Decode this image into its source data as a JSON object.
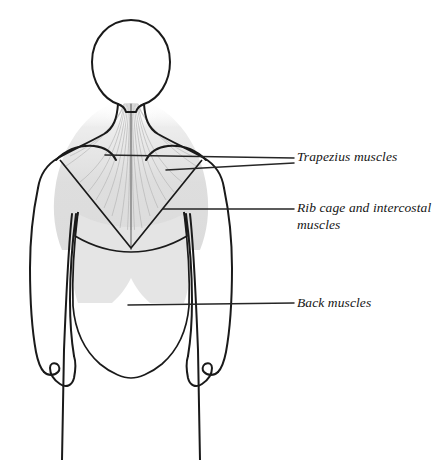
{
  "diagram": {
    "view": "posterior",
    "background_color": "#ffffff",
    "outline_color": "#1a1a1a",
    "shading_color": "#e2e2e2",
    "fiber_color": "#b9b9b9",
    "leader_color": "#262626"
  },
  "labels": [
    {
      "id": "trapezius",
      "text": "Trapezius muscles",
      "leader_count": 2,
      "points_to": "trapezius-region"
    },
    {
      "id": "ribcage",
      "text": "Rib cage and intercostal\nmuscles",
      "leader_count": 1,
      "points_to": "ribcage-region"
    },
    {
      "id": "back",
      "text": "Back muscles",
      "leader_count": 1,
      "points_to": "back-muscle-region"
    }
  ],
  "regions": [
    {
      "id": "trapezius-region",
      "name": "Trapezius muscles",
      "shaded": true,
      "has_fibers": true
    },
    {
      "id": "ribcage-region",
      "name": "Rib cage and intercostal muscles",
      "shaded": true,
      "has_fibers": false
    },
    {
      "id": "back-muscle-region",
      "name": "Back muscles",
      "shaded": false,
      "has_fibers": false
    }
  ],
  "body_parts": [
    {
      "id": "head",
      "name": "head"
    },
    {
      "id": "neck",
      "name": "neck"
    },
    {
      "id": "torso",
      "name": "torso"
    },
    {
      "id": "left-arm",
      "name": "left arm"
    },
    {
      "id": "right-arm",
      "name": "right arm"
    },
    {
      "id": "left-hand",
      "name": "left hand"
    },
    {
      "id": "right-hand",
      "name": "right hand"
    }
  ]
}
